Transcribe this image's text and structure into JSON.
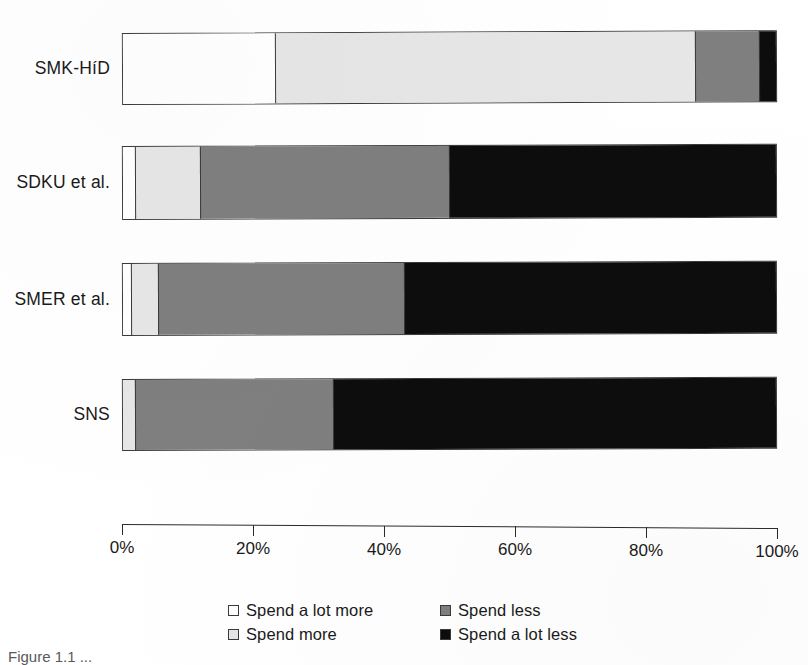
{
  "chart_data": {
    "type": "bar",
    "orientation": "horizontal",
    "stacked": true,
    "stack_mode": "percent",
    "title": "",
    "xlabel": "",
    "ylabel": "",
    "xlim": [
      0,
      100
    ],
    "grid": false,
    "legend_position": "bottom",
    "categories": [
      "SMK-HíD",
      "SDKU et al.",
      "SMER et al.",
      "SNS"
    ],
    "tick_labels": [
      "0%",
      "20%",
      "40%",
      "60%",
      "80%",
      "100%"
    ],
    "tick_values": [
      0,
      20,
      40,
      60,
      80,
      100
    ],
    "series": [
      {
        "name": "Spend a lot more",
        "color": "#ffffff",
        "values": [
          23.2,
          1.8,
          1.2,
          0.0
        ]
      },
      {
        "name": "Spend more",
        "color": "#e6e6e6",
        "values": [
          64.4,
          10.0,
          4.1,
          1.8
        ]
      },
      {
        "name": "Spend less",
        "color": "#7f7f7f",
        "values": [
          9.8,
          38.2,
          37.7,
          30.4
        ]
      },
      {
        "name": "Spend a lot less",
        "color": "#0d0d0d",
        "values": [
          2.6,
          50.0,
          57.0,
          67.8
        ]
      }
    ]
  },
  "caption": "Figure 1.1 ..."
}
